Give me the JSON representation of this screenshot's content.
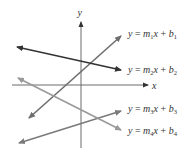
{
  "diagram": {
    "type": "coordinate-plane-lines",
    "axes": {
      "x_label": "x",
      "y_label": "y",
      "color": "#6a6a6a"
    },
    "lines": [
      {
        "id": "line1",
        "m": "m",
        "m_sub": "1",
        "b": "b",
        "b_sub": "1",
        "label": "y = m1x + b1",
        "color": "#6e6e6e",
        "x1": 29,
        "y1": 118,
        "x2": 121,
        "y2": 36
      },
      {
        "id": "line2",
        "m": "m",
        "m_sub": "2",
        "b": "b",
        "b_sub": "2",
        "label": "y = m2x + b2",
        "color": "#333333",
        "x1": 17,
        "y1": 47,
        "x2": 121,
        "y2": 70
      },
      {
        "id": "line3",
        "m": "m",
        "m_sub": "3",
        "b": "b",
        "b_sub": "3",
        "label": "y = m3x + b3",
        "color": "#7a7a7a",
        "x1": 19,
        "y1": 143,
        "x2": 121,
        "y2": 111
      },
      {
        "id": "line4",
        "m": "m",
        "m_sub": "4",
        "b": "b",
        "b_sub": "4",
        "label": "y = m4x + b4",
        "color": "#9a9a9a",
        "x1": 18,
        "y1": 78,
        "x2": 121,
        "y2": 130
      }
    ]
  }
}
